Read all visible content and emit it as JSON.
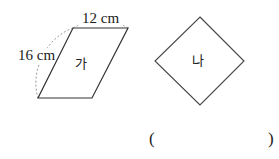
{
  "figures": {
    "parallelogram": {
      "label": "가",
      "top_side": "12 cm",
      "left_side": "16 cm"
    },
    "rhombus": {
      "label": "나"
    }
  },
  "answer": {
    "open_paren": "(",
    "close_paren": ")",
    "value": ""
  }
}
